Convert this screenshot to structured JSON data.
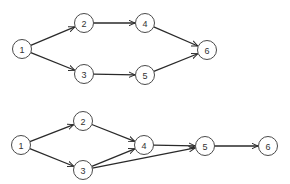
{
  "colors": {
    "background": "#ffffff",
    "node_stroke": "#4a4a4a",
    "edge": "#2a2a2a",
    "label": "#333333"
  },
  "node_radius": 9.5,
  "diagrams": [
    {
      "name": "top-network",
      "nodes": [
        {
          "id": "1",
          "label": "1",
          "x": 22,
          "y": 49
        },
        {
          "id": "2",
          "label": "2",
          "x": 84,
          "y": 23
        },
        {
          "id": "3",
          "label": "3",
          "x": 84,
          "y": 74
        },
        {
          "id": "4",
          "label": "4",
          "x": 145,
          "y": 23
        },
        {
          "id": "5",
          "label": "5",
          "x": 145,
          "y": 75
        },
        {
          "id": "6",
          "label": "6",
          "x": 207,
          "y": 50
        }
      ],
      "edges": [
        {
          "from": "1",
          "to": "2"
        },
        {
          "from": "1",
          "to": "3"
        },
        {
          "from": "2",
          "to": "4"
        },
        {
          "from": "3",
          "to": "5"
        },
        {
          "from": "4",
          "to": "6"
        },
        {
          "from": "5",
          "to": "6"
        }
      ]
    },
    {
      "name": "bottom-network",
      "nodes": [
        {
          "id": "1",
          "label": "1",
          "x": 21,
          "y": 145
        },
        {
          "id": "2",
          "label": "2",
          "x": 83,
          "y": 121
        },
        {
          "id": "3",
          "label": "3",
          "x": 83,
          "y": 170
        },
        {
          "id": "4",
          "label": "4",
          "x": 144,
          "y": 145
        },
        {
          "id": "5",
          "label": "5",
          "x": 205,
          "y": 146
        },
        {
          "id": "6",
          "label": "6",
          "x": 268,
          "y": 146
        }
      ],
      "edges": [
        {
          "from": "1",
          "to": "2"
        },
        {
          "from": "1",
          "to": "3"
        },
        {
          "from": "2",
          "to": "4"
        },
        {
          "from": "3",
          "to": "4"
        },
        {
          "from": "3",
          "to": "5"
        },
        {
          "from": "4",
          "to": "5"
        },
        {
          "from": "5",
          "to": "6"
        }
      ]
    }
  ]
}
